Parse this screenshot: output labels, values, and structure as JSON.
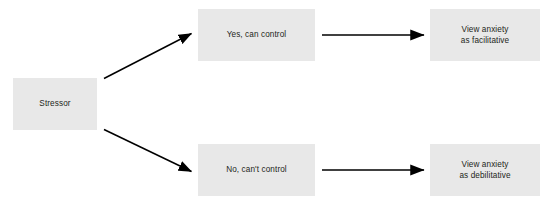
{
  "diagram": {
    "title": "",
    "background_color": "#ffffff",
    "node_fill_color": "#e8e8e8",
    "node_text_color": "#231f20",
    "edge_color": "#000000",
    "nodes": [
      {
        "id": "stressor",
        "label": "Stressor"
      },
      {
        "id": "yes_control",
        "label": "Yes, can control"
      },
      {
        "id": "no_control",
        "label": "No, can't control"
      },
      {
        "id": "facilitative",
        "label": "View anxiety\nas facilitative"
      },
      {
        "id": "debilitative",
        "label": "View anxiety\nas debilitative"
      }
    ],
    "edges": [
      {
        "id": "edge-stressor-yes",
        "from": "stressor",
        "to": "yes_control",
        "label": "",
        "style": "solid-arrow-diagonal-up"
      },
      {
        "id": "edge-stressor-no",
        "from": "stressor",
        "to": "no_control",
        "label": "",
        "style": "solid-arrow-diagonal-down"
      },
      {
        "id": "edge-yes-facilitative",
        "from": "yes_control",
        "to": "facilitative",
        "label": "",
        "style": "solid-arrow-horizontal"
      },
      {
        "id": "edge-no-debilitative",
        "from": "no_control",
        "to": "debilitative",
        "label": "",
        "style": "solid-arrow-horizontal"
      }
    ]
  }
}
